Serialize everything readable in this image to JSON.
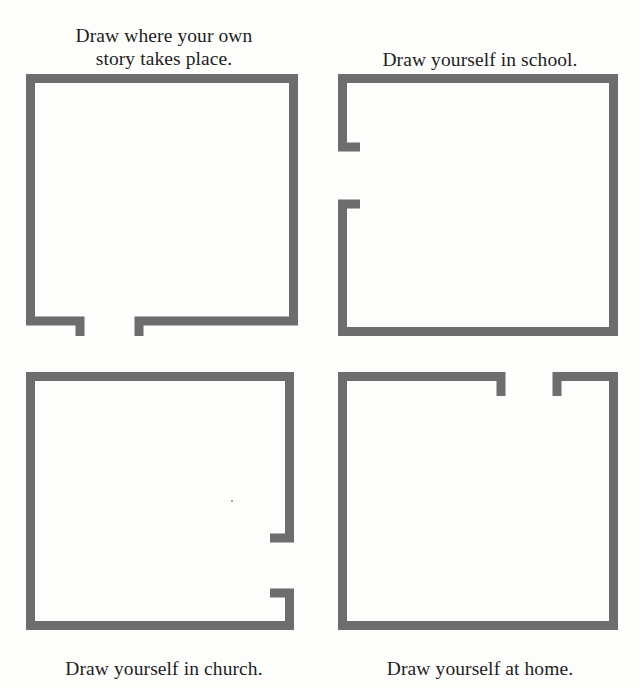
{
  "page": {
    "background_color": "#fdfdfc",
    "ink_color": "#6d6d6d",
    "text_color": "#1d1d1d"
  },
  "panels": [
    {
      "id": "own-story",
      "caption": "Draw where your own\nstory takes place.",
      "caption_position": "top",
      "doorway_side": "bottom"
    },
    {
      "id": "school",
      "caption": "Draw yourself in school.",
      "caption_position": "top",
      "doorway_side": "left"
    },
    {
      "id": "church",
      "caption": "Draw yourself in church.",
      "caption_position": "bottom",
      "doorway_side": "right"
    },
    {
      "id": "home",
      "caption": "Draw yourself at home.",
      "caption_position": "bottom",
      "doorway_side": "top"
    }
  ]
}
